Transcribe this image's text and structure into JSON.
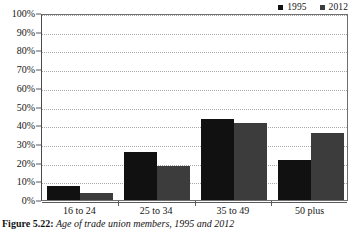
{
  "figure": {
    "number_label": "Figure 5.22:",
    "caption": "Age of trade union members, 1995 and 2012"
  },
  "legend": {
    "position": "top-right",
    "entries": [
      {
        "label": "1995",
        "color": "#111111",
        "icon": "square-marker"
      },
      {
        "label": "2012",
        "color": "#3c3c3c",
        "icon": "square-marker"
      }
    ]
  },
  "axes": {
    "y_ticks": [
      "0%",
      "10%",
      "20%",
      "30%",
      "40%",
      "50%",
      "60%",
      "70%",
      "80%",
      "90%",
      "100%"
    ],
    "x_ticks": [
      "16 to 24",
      "25 to 34",
      "35 to 49",
      "50 plus"
    ]
  },
  "chart_data": {
    "type": "bar",
    "title": "Age of trade union members, 1995 and 2012",
    "xlabel": "",
    "ylabel": "",
    "ylim": [
      0,
      100
    ],
    "ytick_step": 10,
    "grid": true,
    "legend_position": "top-right",
    "categories": [
      "16 to 24",
      "25 to 34",
      "35 to 49",
      "50 plus"
    ],
    "series": [
      {
        "name": "1995",
        "color": "#111111",
        "values": [
          7.5,
          25.5,
          43.5,
          21.5
        ]
      },
      {
        "name": "2012",
        "color": "#3c3c3c",
        "values": [
          4.0,
          18.0,
          41.0,
          36.0
        ]
      }
    ]
  }
}
